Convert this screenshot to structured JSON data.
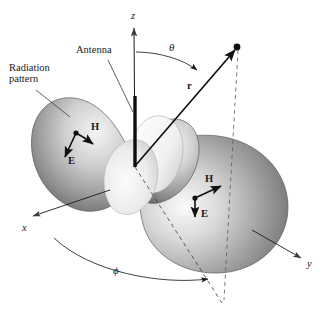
{
  "figure": {
    "background_color": "#ffffff",
    "ink_color": "#1a1a1a",
    "lobe_light": "#f2f2f2",
    "lobe_mid": "#b9b9b9",
    "lobe_dark": "#6e6e6e"
  },
  "labels": {
    "radiation_pattern": "Radiation\npattern",
    "antenna": "Antenna",
    "z_axis": "z",
    "x_axis": "x",
    "y_axis": "y",
    "theta": "θ",
    "phi": "ϕ",
    "r": "r",
    "h_left": "H",
    "e_left": "E",
    "h_right": "H",
    "e_right": "E"
  },
  "geometry": {
    "origin": {
      "x": 135,
      "y": 166
    },
    "z_axis_tip": {
      "x": 134,
      "y": 26
    },
    "x_axis_tip": {
      "x": 32,
      "y": 216
    },
    "y_axis_tip": {
      "x": 302,
      "y": 259
    },
    "field_point": {
      "x": 237,
      "y": 47
    },
    "projection_point": {
      "x": 221,
      "y": 300
    },
    "antenna_top": {
      "x": 135,
      "y": 96
    },
    "antenna_bottom": {
      "x": 135,
      "y": 166
    }
  },
  "vectors": {
    "left_lobe": {
      "origin": {
        "x": 76,
        "y": 133
      },
      "h_tip": {
        "x": 95,
        "y": 145
      },
      "e_tip": {
        "x": 63,
        "y": 159
      }
    },
    "right_lobe": {
      "origin": {
        "x": 195,
        "y": 198
      },
      "h_tip": {
        "x": 223,
        "y": 185
      },
      "e_tip": {
        "x": 195,
        "y": 220
      }
    }
  }
}
